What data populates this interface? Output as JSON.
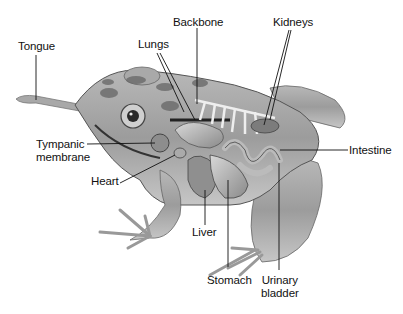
{
  "figure": {
    "colors": {
      "ink": "#111111",
      "background": "#ffffff",
      "skin": "#9a9a9a",
      "spots": "#5a5a5a"
    }
  },
  "labels": {
    "tongue": "Tongue",
    "lungs": "Lungs",
    "backbone": "Backbone",
    "kidneys": "Kidneys",
    "tympanic_line1": "Tympanic",
    "tympanic_line2": "membrane",
    "heart": "Heart",
    "intestine": "Intestine",
    "liver": "Liver",
    "stomach": "Stomach",
    "urinary_line1": "Urinary",
    "urinary_line2": "bladder"
  }
}
